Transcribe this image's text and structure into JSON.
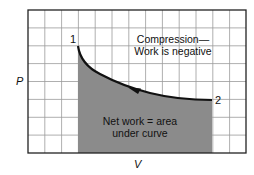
{
  "diagram": {
    "type": "pv-diagram",
    "axes": {
      "x_label": "V",
      "y_label": "P"
    },
    "points": [
      {
        "id": "1",
        "label": "1"
      },
      {
        "id": "2",
        "label": "2"
      }
    ],
    "process": "compression",
    "direction": "from 2 to 1 (arrow points left along curve)",
    "annotations": {
      "top_line1": "Compression—",
      "top_line2": "Work is negative",
      "area_line1": "Net work = area",
      "area_line2": "under curve"
    },
    "colors": {
      "grid": "#8c8c8c",
      "frame": "#222222",
      "curve": "#111111",
      "shaded_area": "#8b8b8b",
      "background": "#ffffff"
    },
    "grid": {
      "columns": 13,
      "rows": 8
    }
  }
}
